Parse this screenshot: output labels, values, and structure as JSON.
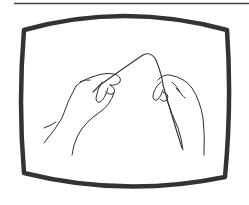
{
  "figure": {
    "colors": {
      "background": "#ffffff",
      "ink": "#2f2f2f",
      "frame": "#333333",
      "rule": "#444444"
    }
  }
}
